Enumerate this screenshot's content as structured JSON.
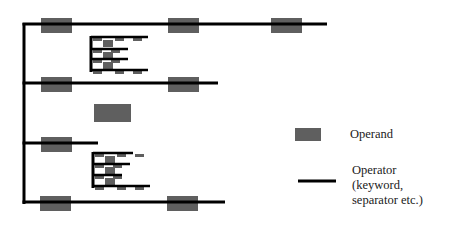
{
  "colors": {
    "operand": "#5f5f5f",
    "operator": "#000000",
    "background": "#ffffff"
  },
  "legend": {
    "operand_label": "Operand",
    "operator_label_lines": [
      "Operator",
      "(keyword,",
      "separator etc.)"
    ]
  },
  "structure": {
    "spine": {
      "x": 24,
      "y1": 23,
      "y2": 204
    },
    "lines": [
      {
        "y": 24,
        "x1": 24,
        "x2": 327,
        "operands": [
          41,
          168,
          271
        ]
      },
      {
        "y": 83,
        "x1": 24,
        "x2": 218,
        "operands": [
          41,
          168
        ]
      },
      {
        "y": 143,
        "x1": 24,
        "x2": 98,
        "operands": [
          41
        ]
      },
      {
        "y": 202,
        "x1": 24,
        "x2": 225,
        "operands": [
          40,
          167
        ]
      }
    ],
    "standalone_operand": {
      "x": 94,
      "y": 104,
      "w": 37,
      "h": 18
    },
    "nested_blocks": [
      {
        "x": 91,
        "y1": 36,
        "y2": 72,
        "lines": [
          {
            "y": 37,
            "x2": 148
          },
          {
            "y": 49,
            "x2": 128
          },
          {
            "y": 59,
            "x2": 128
          },
          {
            "y": 70,
            "x2": 148
          }
        ]
      },
      {
        "x": 93,
        "y1": 152,
        "y2": 188,
        "lines": [
          {
            "y": 153,
            "x2": 133
          },
          {
            "y": 164,
            "x2": 130
          },
          {
            "y": 175,
            "x2": 122
          },
          {
            "y": 186,
            "x2": 150
          }
        ]
      }
    ]
  }
}
